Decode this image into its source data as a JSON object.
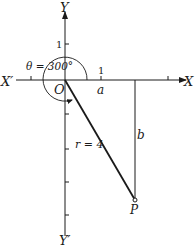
{
  "figure": {
    "axes": {
      "x_pos_label": "X",
      "x_neg_label": "X′",
      "y_pos_label": "Y",
      "y_neg_label": "Y′",
      "origin_label": "O",
      "x_tick_label": "1",
      "y_tick_label": "1"
    },
    "angle_label": "θ = 300°",
    "radius_label": "r = 4",
    "horizontal_label": "a",
    "vertical_label": "b",
    "point_label": "P"
  },
  "colors": {
    "ink": "#1a1a1a",
    "background": "#ffffff"
  }
}
